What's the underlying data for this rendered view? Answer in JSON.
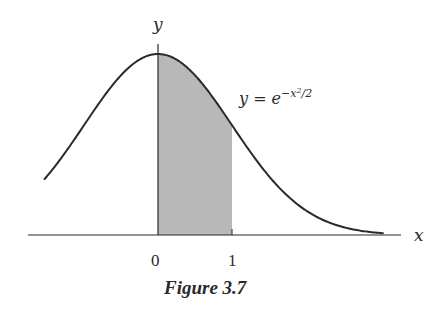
{
  "chart_data": {
    "type": "line",
    "title": "Figure 3.7",
    "function": "y = e^{-x^2/2}",
    "xlabel": "x",
    "ylabel": "y",
    "xlim": [
      -1.54,
      3.05
    ],
    "ylim": [
      0,
      1
    ],
    "x_ticks": [
      0,
      1
    ],
    "x_tick_labels": [
      "0",
      "1"
    ],
    "shaded_region": {
      "from": 0,
      "to": 1,
      "color": "#b8b8b8"
    },
    "curve_color": "#2a2a2a",
    "grid": false,
    "legend": false
  },
  "labels": {
    "y_axis": "y",
    "x_axis": "x",
    "curve_label_lhs": "y = e",
    "curve_label_exp_main": "−x",
    "curve_label_exp_sq": "2",
    "curve_label_exp_tail": "/2",
    "tick_0": "0",
    "tick_1": "1",
    "caption": "Figure 3.7"
  }
}
